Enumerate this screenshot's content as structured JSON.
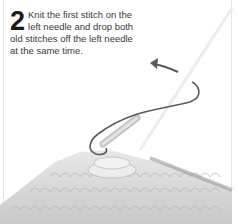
{
  "step": {
    "number": "2",
    "text": "Knit the first stitch on the left needle and drop both old stitches off the left needle at the same time."
  },
  "illustration": {
    "subject": "knitting-needle-with-yarn-and-stitches",
    "arrow_direction": "left"
  },
  "colors": {
    "text": "#3a3a3a",
    "arrow": "#5a5a5a",
    "knit": "#d4d4d4"
  }
}
